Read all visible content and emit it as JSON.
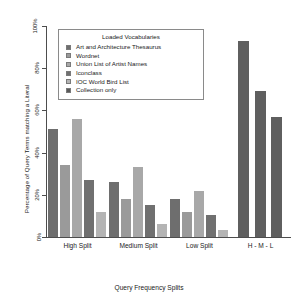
{
  "chart_data": {
    "type": "bar",
    "title": "",
    "xlabel": "Query Frequency Splits",
    "ylabel": "Percentage of Query Terms matching a Literal",
    "categories": [
      "High Split",
      "Medium Split",
      "Low Split",
      "H - M - L"
    ],
    "ylim": [
      0,
      100
    ],
    "ytick_labels": [
      "0%",
      "20%",
      "40%",
      "60%",
      "80%",
      "100%"
    ],
    "ytick_values": [
      0,
      20,
      40,
      60,
      80,
      100
    ],
    "grid": false,
    "legend_position": "upper-left-inside",
    "legend_title": "Loaded Vocabularies",
    "series": [
      {
        "name": "Art and Architecture Thesaurus",
        "color": "#6e6e6e",
        "values": [
          51,
          26,
          18,
          93
        ]
      },
      {
        "name": "Wordnet",
        "color": "#9a9a9a",
        "values": [
          34,
          18,
          12,
          69
        ]
      },
      {
        "name": "Union List of Artist Names",
        "color": "#a8a8a8",
        "values": [
          56,
          33,
          22,
          57
        ]
      },
      {
        "name": "Iconclass",
        "color": "#707070",
        "values": [
          27,
          15,
          10.5,
          null
        ]
      },
      {
        "name": "IOC World Bird List",
        "color": "#b4b4b4",
        "values": [
          12,
          6,
          3.5,
          null
        ]
      },
      {
        "name": "Collection only",
        "color": "#595959",
        "values": [
          null,
          null,
          null,
          null
        ]
      }
    ]
  },
  "axis": {
    "y_title": "Percentage of Query Terms matching a Literal",
    "x_title": "Query Frequency Splits"
  },
  "legend": {
    "title": "Loaded Vocabularies",
    "items": [
      {
        "label": "Art and Architecture Thesaurus",
        "color": "#6e6e6e"
      },
      {
        "label": "Wordnet",
        "color": "#9a9a9a"
      },
      {
        "label": "Union List of Artist Names",
        "color": "#a8a8a8"
      },
      {
        "label": "Iconclass",
        "color": "#707070"
      },
      {
        "label": "IOC World Bird List",
        "color": "#b4b4b4"
      },
      {
        "label": "Collection only",
        "color": "#595959"
      }
    ]
  }
}
